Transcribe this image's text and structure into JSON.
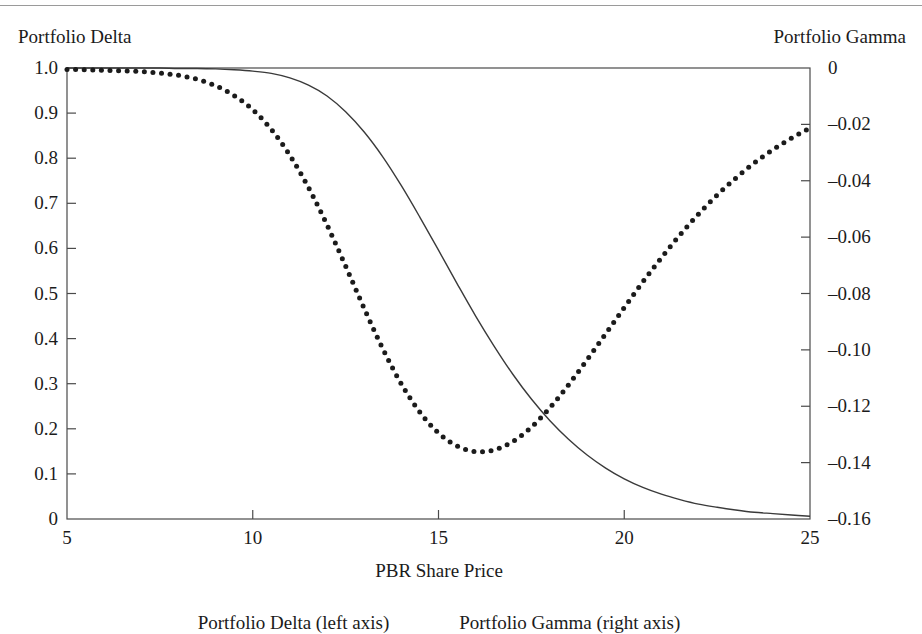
{
  "figure": {
    "left_axis_title": "Portfolio Delta",
    "right_axis_title": "Portfolio Gamma",
    "x_axis_title": "PBR Share Price"
  },
  "legend": {
    "entries": [
      {
        "label": "Portfolio Delta (left axis)"
      },
      {
        "label": "Portfolio Gamma (right axis)"
      }
    ]
  },
  "colors": {
    "ink": "#1b1b1b",
    "frame": "#4a4a4a",
    "rule": "#9a9a9a",
    "delta_line": "#3a3a3a",
    "gamma_dots": "#1b1b1b"
  },
  "chart_data": {
    "type": "line",
    "title": "",
    "xlabel": "PBR Share Price",
    "ylabel": "Portfolio Delta",
    "y2label": "Portfolio Gamma",
    "xlim": [
      5,
      25
    ],
    "ylim": [
      0,
      1.0
    ],
    "y2lim": [
      -0.16,
      0
    ],
    "grid": false,
    "legend_position": "below",
    "x_ticks": [
      5,
      10,
      15,
      20,
      25
    ],
    "x_tick_labels": [
      "5",
      "10",
      "15",
      "20",
      "25"
    ],
    "y_ticks": [
      0,
      0.1,
      0.2,
      0.3,
      0.4,
      0.5,
      0.6,
      0.7,
      0.8,
      0.9,
      1.0
    ],
    "y_tick_labels": [
      "0",
      "0.1",
      "0.2",
      "0.3",
      "0.4",
      "0.5",
      "0.6",
      "0.7",
      "0.8",
      "0.9",
      "1.0"
    ],
    "y2_ticks": [
      0,
      -0.02,
      -0.04,
      -0.06,
      -0.08,
      -0.1,
      -0.12,
      -0.14,
      -0.16
    ],
    "y2_tick_labels": [
      "0",
      "–0.02",
      "–0.04",
      "–0.06",
      "–0.08",
      "–0.10",
      "–0.12",
      "–0.14",
      "–0.16"
    ],
    "x": [
      5.0,
      5.5,
      6.0,
      6.5,
      7.0,
      7.5,
      8.0,
      8.5,
      9.0,
      9.5,
      10.0,
      10.5,
      11.0,
      11.5,
      12.0,
      12.5,
      13.0,
      13.5,
      14.0,
      14.5,
      15.0,
      15.5,
      16.0,
      16.5,
      17.0,
      17.5,
      18.0,
      18.5,
      19.0,
      19.5,
      20.0,
      20.5,
      21.0,
      21.5,
      22.0,
      22.5,
      23.0,
      23.5,
      24.0,
      24.5,
      25.0
    ],
    "series": [
      {
        "name": "Portfolio Delta (left axis)",
        "axis": "left",
        "style": "solid",
        "values": [
          1.0,
          1.0,
          1.0,
          1.0,
          1.0,
          1.0,
          0.999,
          0.999,
          0.998,
          0.996,
          0.993,
          0.988,
          0.978,
          0.962,
          0.938,
          0.903,
          0.858,
          0.803,
          0.739,
          0.669,
          0.596,
          0.522,
          0.45,
          0.383,
          0.321,
          0.266,
          0.218,
          0.177,
          0.142,
          0.113,
          0.089,
          0.07,
          0.055,
          0.043,
          0.033,
          0.026,
          0.02,
          0.015,
          0.012,
          0.009,
          0.006
        ]
      },
      {
        "name": "Portfolio Gamma (right axis)",
        "axis": "right",
        "style": "dotted",
        "values": [
          -0.0005,
          -0.0006,
          -0.0008,
          -0.001,
          -0.0013,
          -0.0018,
          -0.0026,
          -0.004,
          -0.0063,
          -0.0098,
          -0.0148,
          -0.0218,
          -0.031,
          -0.0424,
          -0.0557,
          -0.0703,
          -0.0853,
          -0.0996,
          -0.1121,
          -0.1221,
          -0.1295,
          -0.1341,
          -0.1361,
          -0.1355,
          -0.1325,
          -0.1274,
          -0.1205,
          -0.1124,
          -0.1035,
          -0.0943,
          -0.085,
          -0.0759,
          -0.0673,
          -0.0592,
          -0.0518,
          -0.0451,
          -0.0391,
          -0.0337,
          -0.029,
          -0.0249,
          -0.0213
        ]
      }
    ]
  }
}
